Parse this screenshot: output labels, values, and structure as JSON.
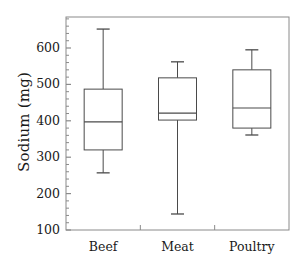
{
  "chart_data": {
    "type": "box",
    "title": "",
    "xlabel": "",
    "ylabel": "Sodium (mg)",
    "ylim": [
      100,
      680
    ],
    "y_ticks": [
      100,
      200,
      300,
      400,
      500,
      600
    ],
    "y_tick_labels": [
      "100",
      "200",
      "300",
      "400",
      "500",
      "600"
    ],
    "minor_ticks": true,
    "grid": false,
    "legend": null,
    "categories": [
      "Beef",
      "Meat",
      "Poultry"
    ],
    "boxes": [
      {
        "name": "Beef",
        "whisker_low": 257,
        "q1": 320,
        "median": 397,
        "q3": 487,
        "whisker_high": 652
      },
      {
        "name": "Meat",
        "whisker_low": 144,
        "q1": 402,
        "median": 421,
        "q3": 518,
        "whisker_high": 562
      },
      {
        "name": "Poultry",
        "whisker_low": 361,
        "q1": 380,
        "median": 435,
        "q3": 540,
        "whisker_high": 595
      }
    ],
    "colors": {
      "line": "#4a4a4a",
      "frame": "#8a8a8a",
      "text": "#1a1a1a",
      "background": "#ffffff"
    }
  }
}
